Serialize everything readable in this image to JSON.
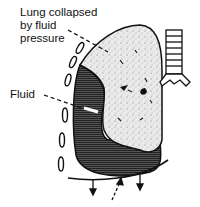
{
  "diagram": {
    "title": "",
    "labels": {
      "lung_line1": "Lung collapsed",
      "lung_line2": "by fluid",
      "lung_line3": "pressure",
      "fluid": "Fluid"
    },
    "colors": {
      "ink": "#111111",
      "fluid": "#3a3a3a",
      "lung": "#e6e6e6",
      "background": "#ffffff"
    }
  }
}
